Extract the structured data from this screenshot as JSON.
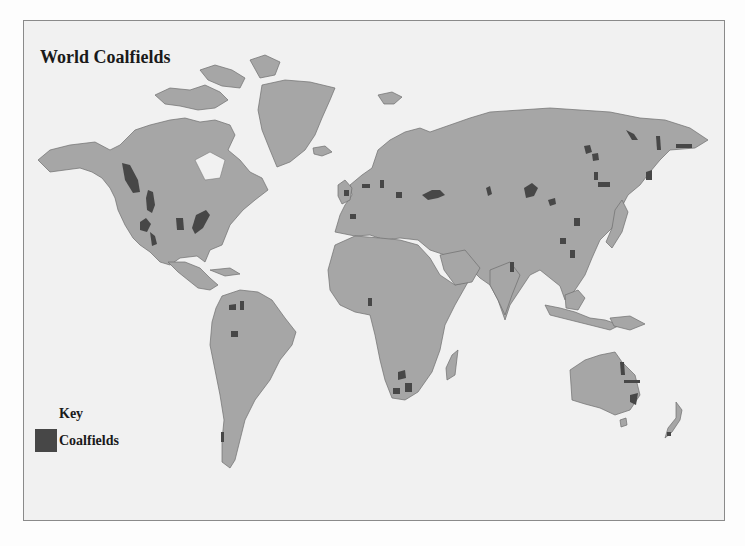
{
  "map": {
    "title": "World Coalfields",
    "colors": {
      "background": "#f1f1f1",
      "land": "#a6a6a6",
      "coalfields": "#474747",
      "frame_border": "#8a8a8a"
    },
    "key": {
      "title": "Key",
      "items": [
        {
          "label": "Coalfields",
          "color": "#474747"
        }
      ]
    },
    "coalfield_regions": [
      "Western Canada / Alberta",
      "Rocky Mountains (US/Canada)",
      "Western US basins",
      "Illinois basin",
      "Appalachians",
      "Colombia / Venezuela",
      "Brazil (Amazon)",
      "Patagonia",
      "Great Britain",
      "Western & Central Europe",
      "Iberia",
      "Poland / Silesia",
      "Donbas / Ukraine",
      "Pechora",
      "Kuznetsk / Karaganda",
      "Central & Eastern Siberia",
      "Northeast Siberia",
      "Kamchatka / Sakhalin",
      "Northern China",
      "Southern China",
      "India",
      "Nigeria",
      "Southern Africa",
      "Eastern Australia",
      "New Zealand"
    ]
  }
}
